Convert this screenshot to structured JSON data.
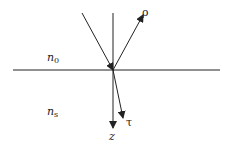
{
  "diagram": {
    "colors": {
      "line": "#222222",
      "background": "#ffffff"
    },
    "interface": {
      "x1": 13,
      "y1": 70,
      "x2": 220,
      "y2": 70
    },
    "normal_axis": {
      "x1": 113,
      "y1": 13,
      "x2": 113,
      "y2": 128,
      "label": "z"
    },
    "rays": [
      {
        "name": "incident",
        "x1": 82,
        "y1": 13,
        "x2": 113,
        "y2": 70,
        "label": ""
      },
      {
        "name": "reflected",
        "x1": 113,
        "y1": 70,
        "x2": 143,
        "y2": 15,
        "label": "ρ"
      },
      {
        "name": "transmitted",
        "x1": 113,
        "y1": 70,
        "x2": 123,
        "y2": 118,
        "label": "τ"
      }
    ],
    "media": [
      {
        "name": "upper-medium",
        "symbol": "n",
        "subscript": "0"
      },
      {
        "name": "lower-medium",
        "symbol": "n",
        "subscript": "s"
      }
    ]
  }
}
